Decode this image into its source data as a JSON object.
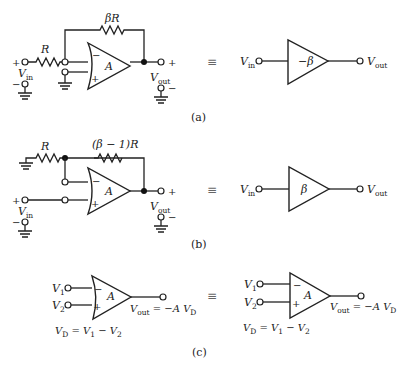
{
  "figure": {
    "panels": [
      {
        "id": "a",
        "caption": "(a)",
        "feedback_resistor": "βR",
        "input_resistor": "R",
        "opamp_gain": "A",
        "input_label": "V",
        "input_sub": "in",
        "output_label": "V",
        "output_sub": "out",
        "plus": "+",
        "minus": "−",
        "equivalent": "≡",
        "equivalent_gain": "−β"
      },
      {
        "id": "b",
        "caption": "(b)",
        "feedback_resistor": "(β − 1)R",
        "ground_resistor": "R",
        "opamp_gain": "A",
        "input_label": "V",
        "input_sub": "in",
        "output_label": "V",
        "output_sub": "out",
        "plus": "+",
        "minus": "−",
        "equivalent": "≡",
        "equivalent_gain": "β"
      },
      {
        "id": "c",
        "caption": "(c)",
        "opamp_gain": "A",
        "input1": "V",
        "input1_sub": "1",
        "input2": "V",
        "input2_sub": "2",
        "output_eq_left": "V",
        "output_eq_sub": "out",
        "output_eq_right": " = −A V",
        "output_eq_right_sub": "D",
        "vd_eq_main": "V",
        "vd_eq_sub": "D",
        "vd_eq_rest": " = V",
        "vd_eq_v1sub": "1",
        "vd_eq_minus": " − V",
        "vd_eq_v2sub": "2",
        "plus": "+",
        "minus": "−",
        "equivalent": "≡"
      }
    ]
  }
}
